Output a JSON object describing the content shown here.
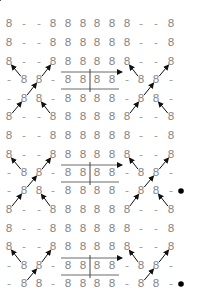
{
  "diagram": {
    "title": "",
    "grid": {
      "cols": 12,
      "rows": 15,
      "col_x": [
        9,
        24,
        39,
        53,
        68,
        83,
        97,
        112,
        127,
        141,
        156,
        171
      ],
      "row_y": [
        24,
        43,
        62,
        80,
        99,
        117,
        136,
        155,
        173,
        191,
        210,
        229,
        247,
        266,
        284
      ],
      "cells": [
        [
          "8",
          "-",
          "-",
          "8",
          "8",
          "8",
          "8",
          "8",
          "8",
          "-",
          "-",
          "8"
        ],
        [
          "8",
          "-",
          "-",
          "8",
          "8",
          "8",
          "8",
          "8",
          "8",
          "-",
          "-",
          "8"
        ],
        [
          "8",
          "-",
          "-",
          "8",
          "8",
          "8",
          "8",
          "8",
          "8",
          "-",
          "-",
          "8"
        ],
        [
          "-",
          "8",
          "8",
          "-",
          "8",
          "8",
          "8",
          "8",
          "-",
          "8",
          "8",
          "-"
        ],
        [
          "-",
          "8",
          "8",
          "-",
          "8",
          "8",
          "8",
          "8",
          "-",
          "8",
          "8",
          "-"
        ],
        [
          "8",
          "-",
          "-",
          "8",
          "8",
          "8",
          "8",
          "8",
          "8",
          "-",
          "-",
          "8"
        ],
        [
          "8",
          "-",
          "-",
          "8",
          "8",
          "8",
          "8",
          "8",
          "8",
          "-",
          "-",
          "8"
        ],
        [
          "8",
          "-",
          "-",
          "8",
          "8",
          "8",
          "8",
          "8",
          "8",
          "-",
          "-",
          "8"
        ],
        [
          "-",
          "8",
          "8",
          "-",
          "8",
          "8",
          "8",
          "8",
          "-",
          "8",
          "8",
          "-"
        ],
        [
          "-",
          "8",
          "8",
          "-",
          "8",
          "8",
          "8",
          "8",
          "-",
          "8",
          "8",
          "-"
        ],
        [
          "8",
          "-",
          "-",
          "8",
          "8",
          "8",
          "8",
          "8",
          "8",
          "-",
          "-",
          "8"
        ],
        [
          "8",
          "-",
          "-",
          "8",
          "8",
          "8",
          "8",
          "8",
          "8",
          "-",
          "-",
          "8"
        ],
        [
          "8",
          "-",
          "-",
          "8",
          "8",
          "8",
          "8",
          "8",
          "8",
          "-",
          "-",
          "8"
        ],
        [
          "-",
          "8",
          "8",
          "-",
          "8",
          "8",
          "8",
          "8",
          "-",
          "8",
          "8",
          "-"
        ],
        [
          "-",
          "8",
          "8",
          "-",
          "8",
          "8",
          "8",
          "8",
          "-",
          "8",
          "8",
          "-"
        ]
      ]
    },
    "boxes": [
      {
        "row": 3,
        "from_col": 4,
        "to_col": 7
      },
      {
        "row": 8,
        "from_col": 4,
        "to_col": 7
      },
      {
        "row": 13,
        "from_col": 4,
        "to_col": 7
      }
    ],
    "cross_arrow_groups": [
      {
        "top_row": 2,
        "side": "left"
      },
      {
        "top_row": 2,
        "side": "right"
      },
      {
        "top_row": 7,
        "side": "left"
      },
      {
        "top_row": 7,
        "side": "right"
      },
      {
        "top_row": 12,
        "side": "left"
      },
      {
        "top_row": 12,
        "side": "right"
      }
    ],
    "dots": [
      {
        "row": 9,
        "x": 181
      },
      {
        "row": 14,
        "x": 181
      }
    ],
    "colors": {
      "glyph": "#8a8a8a",
      "arrow": "#111111",
      "line": "#444444",
      "dot": "#000000",
      "background": "#ffffff"
    }
  }
}
